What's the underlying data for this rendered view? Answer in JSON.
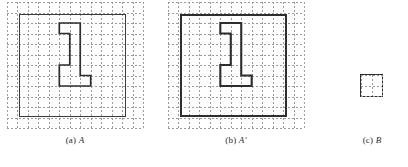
{
  "figure": {
    "background_color": "#ffffff",
    "grid_color": "#9a9a9a",
    "shape_color": "#2e2e2e",
    "panels": [
      {
        "id": "panel-a",
        "caption_index": "(a)",
        "caption_label": "A",
        "caption_prime": "",
        "grid": {
          "cols": 13,
          "rows": 12,
          "cell": 10.4
        },
        "outer_rect": {
          "x": 1,
          "y": 1,
          "w": 11,
          "h": 10
        },
        "inner_polygon": [
          [
            5,
            2
          ],
          [
            7,
            2
          ],
          [
            7,
            7
          ],
          [
            8,
            7
          ],
          [
            8,
            8
          ],
          [
            5,
            8
          ],
          [
            5,
            6
          ],
          [
            6,
            6
          ],
          [
            6,
            3
          ],
          [
            5,
            3
          ]
        ]
      },
      {
        "id": "panel-b",
        "caption_index": "(b)",
        "caption_label": "A",
        "caption_prime": "′",
        "grid": {
          "cols": 13,
          "rows": 12,
          "cell": 10.4
        },
        "outer_rect": {
          "x": 1,
          "y": 1,
          "w": 11,
          "h": 10
        },
        "inner_polygon": [
          [
            5,
            2
          ],
          [
            7,
            2
          ],
          [
            7,
            7
          ],
          [
            8,
            7
          ],
          [
            8,
            8
          ],
          [
            5,
            8
          ],
          [
            5,
            6
          ],
          [
            6,
            6
          ],
          [
            6,
            3
          ],
          [
            5,
            3
          ]
        ]
      },
      {
        "id": "panel-c",
        "caption_index": "(c)",
        "caption_label": "B",
        "caption_prime": "",
        "grid": {
          "cols": 2,
          "rows": 2,
          "cell": 11
        },
        "outer_rect": {
          "x": 0,
          "y": 0,
          "w": 2,
          "h": 2
        },
        "inner_polygon": []
      }
    ]
  }
}
